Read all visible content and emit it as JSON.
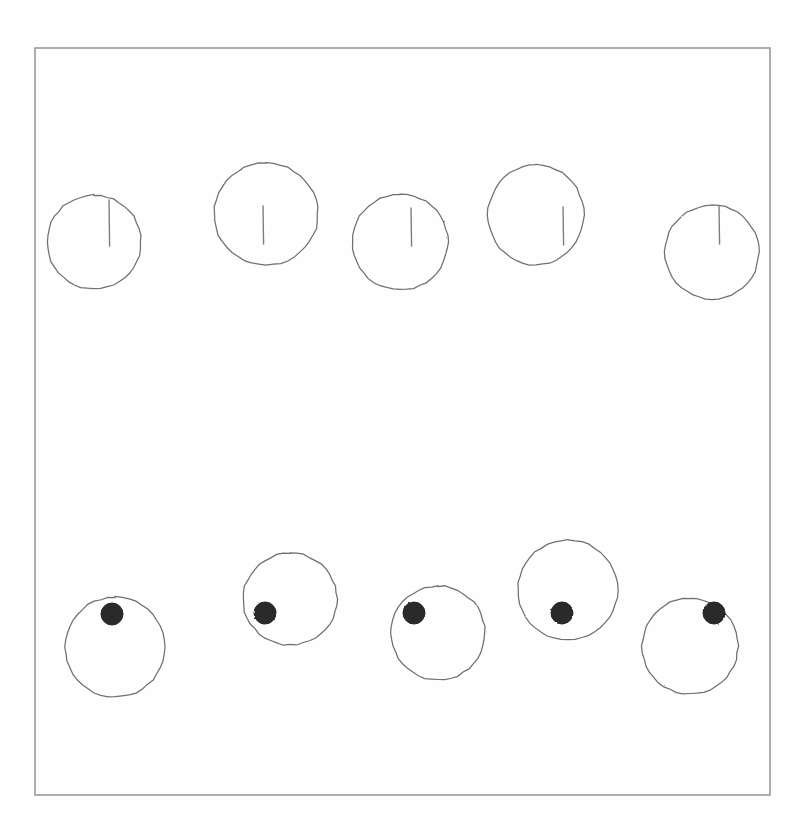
{
  "figure": {
    "background_color": "#fefefe",
    "stroke_color": "#6f6f6f",
    "frame_color": "#9a9a9a",
    "dot_color": "#2a2a2a",
    "tick_color": "#7a7a7a",
    "frame": {
      "x": 35,
      "y": 48,
      "width": 735,
      "height": 747
    },
    "row_labels": {
      "top": "circles with vertical tick marks",
      "bottom": "circles with filled dot markers"
    }
  },
  "chart_data": {
    "type": "scatter",
    "xlabel": "",
    "ylabel": "",
    "xlim": [
      35,
      770
    ],
    "ylim": [
      48,
      795
    ],
    "grid": false,
    "legend": "none",
    "series": [
      {
        "name": "top-row-circles-with-tick",
        "marker": "circle-outline-with-vertical-tick",
        "values": [
          {
            "index": 1,
            "cx": 94,
            "cy": 242,
            "rx": 47,
            "ry": 47,
            "tick_x": 109,
            "tick_y1": 200,
            "tick_y2": 246
          },
          {
            "index": 2,
            "cx": 266,
            "cy": 214,
            "rx": 52,
            "ry": 51,
            "tick_x": 263,
            "tick_y1": 206,
            "tick_y2": 244
          },
          {
            "index": 3,
            "cx": 400,
            "cy": 242,
            "rx": 48,
            "ry": 48,
            "tick_x": 411,
            "tick_y1": 208,
            "tick_y2": 246
          },
          {
            "index": 4,
            "cx": 536,
            "cy": 215,
            "rx": 48,
            "ry": 50,
            "tick_x": 563,
            "tick_y1": 207,
            "tick_y2": 245
          },
          {
            "index": 5,
            "cx": 712,
            "cy": 252,
            "rx": 47,
            "ry": 47,
            "tick_x": 719,
            "tick_y1": 206,
            "tick_y2": 244
          }
        ]
      },
      {
        "name": "bottom-row-circles-with-dot",
        "marker": "circle-outline-with-filled-dot",
        "values": [
          {
            "index": 1,
            "cx": 115,
            "cy": 647,
            "rx": 50,
            "ry": 50,
            "dot_x": 112,
            "dot_y": 614,
            "dot_r": 11
          },
          {
            "index": 2,
            "cx": 290,
            "cy": 599,
            "rx": 47,
            "ry": 46,
            "dot_x": 265,
            "dot_y": 613,
            "dot_r": 11
          },
          {
            "index": 3,
            "cx": 438,
            "cy": 633,
            "rx": 47,
            "ry": 47,
            "dot_x": 414,
            "dot_y": 613,
            "dot_r": 11
          },
          {
            "index": 4,
            "cx": 568,
            "cy": 590,
            "rx": 50,
            "ry": 50,
            "dot_x": 562,
            "dot_y": 613,
            "dot_r": 11
          },
          {
            "index": 5,
            "cx": 690,
            "cy": 646,
            "rx": 48,
            "ry": 48,
            "dot_x": 714,
            "dot_y": 613,
            "dot_r": 11
          }
        ]
      }
    ]
  }
}
